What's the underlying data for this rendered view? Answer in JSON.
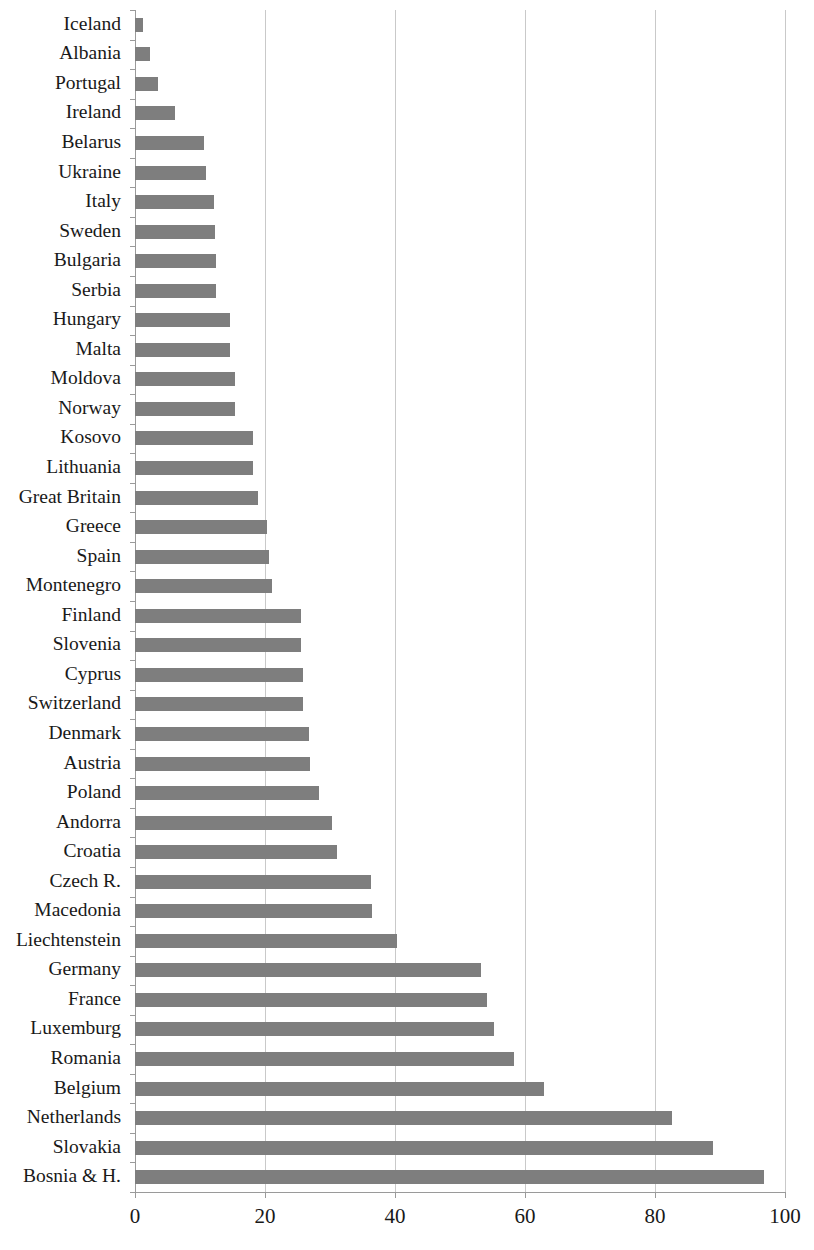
{
  "chart_data": {
    "type": "bar",
    "orientation": "horizontal",
    "title": "",
    "subtitle": "",
    "xlabel": "",
    "ylabel": "",
    "xlim": [
      0,
      100
    ],
    "ylim": null,
    "grid": true,
    "gridlines_axis": "x",
    "legend": null,
    "legend_position": "none",
    "bar_color": "#7e7e7e",
    "gridline_color": "#c9c9c9",
    "axis_color": "#9a9a9a",
    "background_color": "#ffffff",
    "xticks": [
      0,
      20,
      40,
      60,
      80,
      100
    ],
    "xtick_labels": [
      "0",
      "20",
      "40",
      "60",
      "80",
      "100"
    ],
    "categories": [
      "Iceland",
      "Albania",
      "Portugal",
      "Ireland",
      "Belarus",
      "Ukraine",
      "Italy",
      "Sweden",
      "Bulgaria",
      "Serbia",
      "Hungary",
      "Malta",
      "Moldova",
      "Norway",
      "Kosovo",
      "Lithuania",
      "Great Britain",
      "Greece",
      "Spain",
      "Montenegro",
      "Finland",
      "Slovenia",
      "Cyprus",
      "Switzerland",
      "Denmark",
      "Austria",
      "Poland",
      "Andorra",
      "Croatia",
      "Czech R.",
      "Macedonia",
      "Liechtenstein",
      "Germany",
      "France",
      "Luxemburg",
      "Romania",
      "Belgium",
      "Netherlands",
      "Slovakia",
      "Bosnia & H."
    ],
    "values": [
      1.2,
      2.3,
      3.6,
      6.2,
      10.6,
      10.9,
      12.1,
      12.3,
      12.4,
      12.4,
      14.6,
      14.6,
      15.4,
      15.4,
      18.1,
      18.1,
      18.9,
      20.3,
      20.6,
      21.0,
      25.5,
      25.5,
      25.8,
      25.8,
      26.8,
      26.9,
      28.3,
      30.3,
      31.0,
      36.3,
      36.4,
      40.3,
      53.3,
      54.1,
      55.3,
      58.3,
      62.9,
      82.6,
      88.9,
      96.8
    ]
  }
}
